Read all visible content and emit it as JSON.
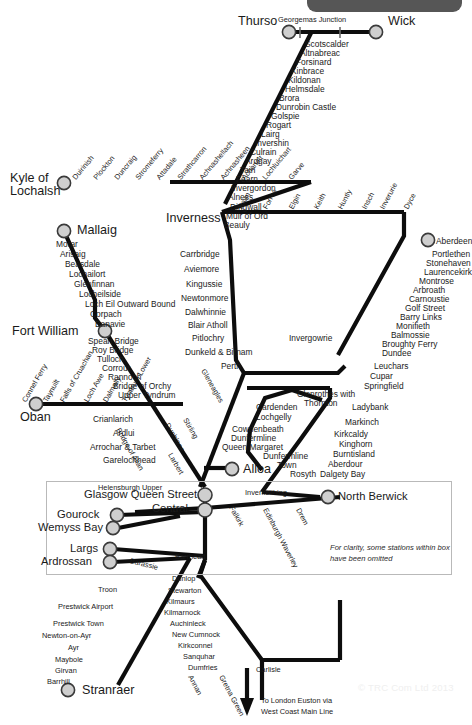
{
  "header": {
    "toolbar_label": ""
  },
  "map": {
    "title": "Scotland rail network map",
    "termini": [
      {
        "name": "Thurso",
        "x": 262,
        "y": 21,
        "anchor": "right"
      },
      {
        "name": "Wick",
        "x": 415,
        "y": 21,
        "anchor": "left"
      },
      {
        "name": "Kyle of",
        "x": 11,
        "y": 175,
        "anchor": "left"
      },
      {
        "name": "Lochalsh",
        "x": 11,
        "y": 187,
        "anchor": "left"
      },
      {
        "name": "Mallaig",
        "x": 44,
        "y": 225,
        "anchor": "left"
      },
      {
        "name": "Inverness",
        "x": 168,
        "y": 218,
        "anchor": "left"
      },
      {
        "name": "Fort William",
        "x": 12,
        "y": 331,
        "anchor": "left"
      },
      {
        "name": "Oban",
        "x": 22,
        "y": 411,
        "anchor": "left"
      },
      {
        "name": "Aberdeen",
        "x": 436,
        "y": 240,
        "anchor": "left"
      },
      {
        "name": "Alloa",
        "x": 243,
        "y": 470,
        "anchor": "left"
      },
      {
        "name": "Glasgow Queen Street",
        "x": 85,
        "y": 495,
        "anchor": "left"
      },
      {
        "name": "Central",
        "x": 140,
        "y": 509,
        "anchor": "left"
      },
      {
        "name": "North Berwick",
        "x": 338,
        "y": 497,
        "anchor": "left"
      },
      {
        "name": "Gourock",
        "x": 57,
        "y": 515,
        "anchor": "left"
      },
      {
        "name": "Wemyss Bay",
        "x": 40,
        "y": 528,
        "anchor": "left"
      },
      {
        "name": "Largs",
        "x": 74,
        "y": 549,
        "anchor": "left"
      },
      {
        "name": "Ardrossan",
        "x": 47,
        "y": 562,
        "anchor": "left"
      },
      {
        "name": "Stranraer",
        "x": 75,
        "y": 690,
        "anchor": "left"
      }
    ],
    "lines": {
      "far_north": {
        "label": "Far North Line",
        "junction": "Georgemas Junction",
        "stations": [
          "Scotscalder",
          "Altnabreac",
          "Forsinard",
          "Kinbrace",
          "Kildonan",
          "Helmsdale",
          "Brora",
          "Dunrobin Castle",
          "Golspie",
          "Rogart",
          "Lairg",
          "Invershin",
          "Culrain",
          "Ardgay",
          "Tain",
          "Fearn",
          "Invergordon",
          "Alness",
          "Dingwall",
          "Muir of Ord",
          "Beauly"
        ]
      },
      "kyle": {
        "label": "Kyle Line",
        "stations": [
          "Duirinish",
          "Plockton",
          "Duncraig",
          "Stromeferry",
          "Attadale",
          "Strathcarron",
          "Achnashellach",
          "Achnasheen",
          "Achanalt",
          "Lochluichart",
          "Garve"
        ]
      },
      "mallaig": {
        "label": "Mallaig Extension",
        "stations": [
          "Morar",
          "Arisaig",
          "Beasdale",
          "Lochailort",
          "Glenfinnan",
          "Locheilside",
          "Loch Eil Outward Bound",
          "Corpach",
          "Banavie"
        ]
      },
      "west_highland": {
        "label": "West Highland Line",
        "stations": [
          "Spean Bridge",
          "Roy Bridge",
          "Tulloch",
          "Corrour",
          "Rannoch",
          "Bridge of Orchy",
          "Upper Tyndrum",
          "Crianlarich",
          "Ardlui",
          "Arrochar & Tarbet",
          "Garelochhead",
          "Helensburgh Upper"
        ]
      },
      "oban": {
        "label": "Oban Line",
        "stations": [
          "Connel Ferry",
          "Taynuilt",
          "Falls of Cruachan",
          "Loch Awe",
          "Dalmally",
          "Tyndrum Lower"
        ]
      },
      "highland_main": {
        "label": "Highland Main Line",
        "stations": [
          "Carrbridge",
          "Aviemore",
          "Kingussie",
          "Newtonmore",
          "Dalwhinnie",
          "Blair Atholl",
          "Pitlochry",
          "Dunkeld & Birnam",
          "Perth"
        ]
      },
      "aberdeen_inverness": {
        "label": "Aberdeen to Inverness Line",
        "stations": [
          "Nairn",
          "Forres",
          "Elgin",
          "Keith",
          "Huntly",
          "Insch",
          "Inverurie",
          "Dyce"
        ]
      },
      "east_coast": {
        "label": "Aberdeen to Dundee",
        "stations": [
          "Portlethen",
          "Stonehaven",
          "Laurencekirk",
          "Montrose",
          "Arbroath",
          "Carnoustie",
          "Golf Street",
          "Barry Links",
          "Monifieth",
          "Balmossie",
          "Broughty Ferry",
          "Dundee",
          "Invergowrie"
        ]
      },
      "fife": {
        "label": "Fife Circle",
        "stations": [
          "Leuchars",
          "Cupar",
          "Springfield",
          "Ladybank",
          "Markinch",
          "Glenrothes with",
          "Thornton",
          "Cardenden",
          "Lochgelly",
          "Cowdenbeath",
          "Dunfermline",
          "Queen Margaret",
          "Dunfermline",
          "Town",
          "Rosyth",
          "Kirkcaldy",
          "Kinghorn",
          "Burntisland",
          "Aberdour",
          "Dalgety Bay",
          "Inverkeithing"
        ]
      },
      "stirling": {
        "label": "Stirling and Edinburgh",
        "stations": [
          "Gleneagles",
          "Dunblane",
          "Bridge of Allan",
          "Stirling",
          "Larbert",
          "Falkirk",
          "Edinburgh Waverley",
          "Drem"
        ]
      },
      "ayrshire": {
        "label": "Ayrshire and Stranraer Line",
        "stations": [
          "Barassie",
          "Barrhead",
          "Troon",
          "Prestwick Airport",
          "Prestwick Town",
          "Newton-on-Ayr",
          "Ayr",
          "Maybole",
          "Girvan",
          "Barrhill"
        ]
      },
      "nith": {
        "label": "Glasgow South Western Line",
        "stations": [
          "Dunlop",
          "Stewarton",
          "Kilmaurs",
          "Kilmarnock",
          "Auchinleck",
          "New Cumnock",
          "Kirkconnel",
          "Sanquhar",
          "Dumfries",
          "Annan",
          "Gretna Green",
          "Carlisle"
        ]
      }
    },
    "note": "For clarity, some stations within box have been omitted",
    "onward": "To London Euston via",
    "onward2": "West Coast Main Line",
    "watermark": "© TRC Com Ltd 2013"
  },
  "colors": {
    "line": "#0d0d0d",
    "station_fill": "#cfcfcf",
    "station_stroke": "#3a3a3a",
    "toolbar": "#565656",
    "inset_border": "#b9b9b9",
    "background": "#ffffff"
  }
}
